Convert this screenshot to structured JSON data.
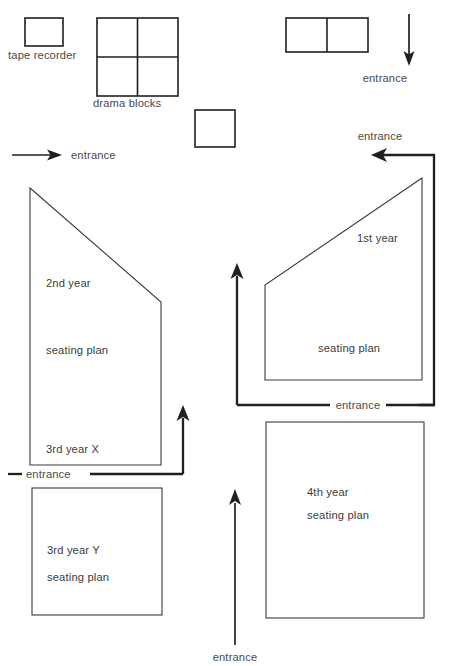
{
  "diagram": {
    "background_color": "#ffffff",
    "line_color": "#231f20",
    "text_color": "#4a4a4a",
    "objects": {
      "tape_recorder_label": "tape recorder",
      "drama_blocks_label": "drama blocks"
    },
    "zones": [
      {
        "id": "second-third-x",
        "shape": "pentagon",
        "lines": [
          "2nd year",
          "seating plan",
          "3rd year X"
        ],
        "line_1": "2nd year",
        "line_2": "seating plan",
        "line_3": "3rd year X"
      },
      {
        "id": "third-y",
        "shape": "rectangle",
        "line_1": "3rd year Y",
        "line_2": "seating plan"
      },
      {
        "id": "first-year",
        "shape": "pentagon",
        "line_1": "1st year",
        "line_2": "seating plan"
      },
      {
        "id": "fourth-year",
        "shape": "rectangle",
        "line_1": "4th year",
        "line_2": "seating plan"
      }
    ],
    "entrances": [
      {
        "id": "top-right-down",
        "label": "entrance",
        "direction": "down"
      },
      {
        "id": "right-upper-left",
        "label": "entrance",
        "direction": "left"
      },
      {
        "id": "left-upper-right",
        "label": "entrance",
        "direction": "right"
      },
      {
        "id": "left-lower",
        "label": "entrance",
        "direction": "up"
      },
      {
        "id": "center-right",
        "label": "entrance",
        "direction": "up"
      },
      {
        "id": "bottom-center",
        "label": "entrance",
        "direction": "up"
      }
    ]
  }
}
